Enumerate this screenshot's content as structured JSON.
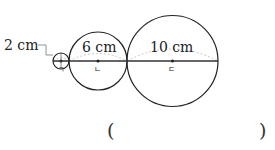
{
  "diagram": {
    "circles": [
      {
        "id": "small",
        "diameter_label": "2 cm",
        "center_label": "ㄱ"
      },
      {
        "id": "medium",
        "diameter_label": "6 cm",
        "center_label": "ㄴ"
      },
      {
        "id": "large",
        "diameter_label": "10 cm",
        "center_label": "ㄷ"
      }
    ],
    "answer": {
      "open": "(",
      "close": ")",
      "value": ""
    }
  },
  "colors": {
    "stroke": "#222222",
    "dashed_arc": "#bbbbbb"
  }
}
